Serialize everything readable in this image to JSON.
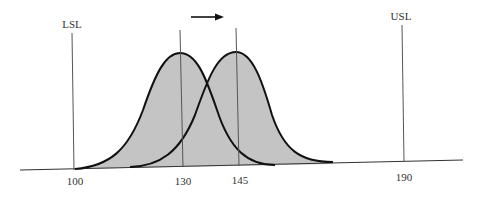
{
  "diagram": {
    "spec_limits": {
      "lower": {
        "label": "LSL",
        "value": 100
      },
      "upper": {
        "label": "USL",
        "value": 190
      }
    },
    "axis_ticks": [
      "100",
      "130",
      "145",
      "190"
    ],
    "distributions": [
      {
        "name": "original",
        "mean": 130,
        "mean_label": "130"
      },
      {
        "name": "shifted",
        "mean": 145,
        "mean_label": "145"
      }
    ],
    "shift_arrow": {
      "direction": "right",
      "from": 130,
      "to": 145
    },
    "colors": {
      "fill": "#c4c4c4",
      "curve": "#111111",
      "lines": "#555555",
      "baseline": "#333333"
    }
  }
}
